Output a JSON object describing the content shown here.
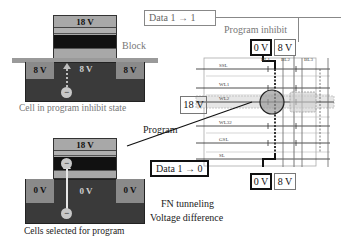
{
  "top_cell": {
    "gate_voltage": "18 V",
    "source_voltage": "8 V",
    "channel_voltage": "8 V",
    "drain_voltage": "8 V",
    "block_label": "Block",
    "caption": "Cell in program inhibit state",
    "electron_symbol": "−"
  },
  "bottom_cell": {
    "gate_voltage": "18 V",
    "source_voltage": "0 V",
    "channel_voltage": "0 V",
    "drain_voltage": "0 V",
    "caption": "Cells selected for program",
    "electron_symbol": "−"
  },
  "array": {
    "inhibit_box": "Data 1 → 1",
    "inhibit_title": "Program inhibit",
    "top_bl_voltages": [
      "0 V",
      "8 V"
    ],
    "bottom_bl_voltages": [
      "0 V",
      "8 V"
    ],
    "bitlines": [
      "BL1",
      "BL2",
      "BL3"
    ],
    "wordlines": [
      "SSL",
      "WL1",
      "WL2",
      "WL32",
      "GSL",
      "SL"
    ],
    "wl_voltage": "18 V",
    "program_label": "Program",
    "program_box": "Data 1 → 0",
    "fn_label_line1": "FN tunneling",
    "fn_label_line2": "Voltage difference"
  },
  "colors": {
    "gate_light": "#a8a8a8",
    "gate_dark": "#111111",
    "substrate": "#3a3a3a",
    "diffusion": "#8a8a8a",
    "oxide_bar": "#9a9a9a",
    "electron": "#c8c8c8",
    "highlight_circle": "#9a9a9a"
  }
}
